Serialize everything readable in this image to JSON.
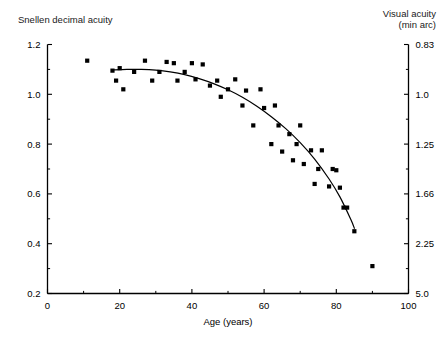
{
  "figure": {
    "left_axis_title": "Snellen decimal acuity",
    "right_axis_title_line1": "Visual acuity",
    "right_axis_title_line2": "(min arc)",
    "xlabel": "Age (years)"
  },
  "chart_data": {
    "type": "scatter",
    "title": "",
    "xlabel": "Age (years)",
    "ylabel": "Snellen decimal acuity",
    "y2label": "Visual acuity (min arc)",
    "xlim": [
      0,
      100
    ],
    "ylim": [
      0.2,
      1.2
    ],
    "grid": false,
    "legend": false,
    "xticks": [
      0,
      20,
      40,
      60,
      80,
      100
    ],
    "xticklabels": [
      "0",
      "20",
      "40",
      "60",
      "80",
      "100"
    ],
    "x_minor_ticks": [
      10,
      30,
      50,
      70,
      90
    ],
    "yticks": [
      0.2,
      0.4,
      0.6,
      0.8,
      1.0,
      1.2
    ],
    "yticklabels": [
      "0.2",
      "0.4",
      "0.6",
      "0.8",
      "1.0",
      "1.2"
    ],
    "y_minor_ticks": [
      0.3,
      0.5,
      0.7,
      0.9,
      1.1
    ],
    "y2ticks_at_y": [
      1.2,
      1.0,
      0.8,
      0.6,
      0.4,
      0.2
    ],
    "y2ticklabels": [
      "0.83",
      "1.0",
      "1.25",
      "1.66",
      "2.25",
      "5.0"
    ],
    "y2_minor_at_y": [
      1.1,
      0.9,
      0.7,
      0.5,
      0.3
    ],
    "marker": "square",
    "marker_color": "#000000",
    "marker_size_px": 4.2,
    "points": [
      {
        "x": 11,
        "y": 1.135
      },
      {
        "x": 18,
        "y": 1.095
      },
      {
        "x": 19,
        "y": 1.055
      },
      {
        "x": 20,
        "y": 1.105
      },
      {
        "x": 21,
        "y": 1.02
      },
      {
        "x": 24,
        "y": 1.09
      },
      {
        "x": 27,
        "y": 1.135
      },
      {
        "x": 29,
        "y": 1.055
      },
      {
        "x": 31,
        "y": 1.09
      },
      {
        "x": 33,
        "y": 1.13
      },
      {
        "x": 35,
        "y": 1.125
      },
      {
        "x": 36,
        "y": 1.055
      },
      {
        "x": 38,
        "y": 1.09
      },
      {
        "x": 40,
        "y": 1.125
      },
      {
        "x": 41,
        "y": 1.06
      },
      {
        "x": 43,
        "y": 1.12
      },
      {
        "x": 45,
        "y": 1.035
      },
      {
        "x": 47,
        "y": 1.055
      },
      {
        "x": 48,
        "y": 0.99
      },
      {
        "x": 50,
        "y": 1.02
      },
      {
        "x": 52,
        "y": 1.06
      },
      {
        "x": 54,
        "y": 0.955
      },
      {
        "x": 55,
        "y": 1.015
      },
      {
        "x": 57,
        "y": 0.875
      },
      {
        "x": 59,
        "y": 1.02
      },
      {
        "x": 60,
        "y": 0.945
      },
      {
        "x": 62,
        "y": 0.8
      },
      {
        "x": 63,
        "y": 0.955
      },
      {
        "x": 64,
        "y": 0.875
      },
      {
        "x": 65,
        "y": 0.77
      },
      {
        "x": 67,
        "y": 0.84
      },
      {
        "x": 68,
        "y": 0.735
      },
      {
        "x": 69,
        "y": 0.8
      },
      {
        "x": 70,
        "y": 0.875
      },
      {
        "x": 71,
        "y": 0.72
      },
      {
        "x": 73,
        "y": 0.775
      },
      {
        "x": 74,
        "y": 0.64
      },
      {
        "x": 75,
        "y": 0.7
      },
      {
        "x": 76,
        "y": 0.775
      },
      {
        "x": 78,
        "y": 0.63
      },
      {
        "x": 79,
        "y": 0.7
      },
      {
        "x": 80,
        "y": 0.695
      },
      {
        "x": 81,
        "y": 0.625
      },
      {
        "x": 82,
        "y": 0.545
      },
      {
        "x": 83,
        "y": 0.545
      },
      {
        "x": 85,
        "y": 0.45
      },
      {
        "x": 90,
        "y": 0.31
      }
    ],
    "fit_curve": {
      "name": "fitted trend",
      "color": "#000000",
      "width_px": 1.2,
      "x": [
        18,
        22,
        26,
        30,
        34,
        38,
        42,
        46,
        50,
        54,
        58,
        62,
        66,
        70,
        74,
        78,
        81,
        84,
        85
      ],
      "y": [
        1.098,
        1.1,
        1.1,
        1.097,
        1.09,
        1.079,
        1.063,
        1.043,
        1.018,
        0.988,
        0.952,
        0.91,
        0.862,
        0.806,
        0.74,
        0.66,
        0.588,
        0.498,
        0.462
      ]
    }
  }
}
